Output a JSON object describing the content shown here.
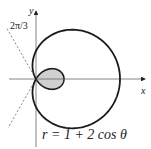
{
  "diagram": {
    "type": "polar-curve",
    "curve_name": "limacon",
    "equation_label": "r = 1 + 2 cos θ",
    "angle_label": "2π/3",
    "axis_labels": {
      "x": "x",
      "y": "y"
    },
    "parameters": {
      "a": 1,
      "b": 2
    },
    "shaded_region": "inner loop",
    "boundary_angles": [
      "2π/3",
      "4π/3"
    ],
    "colors": {
      "curve": "#1a1a1a",
      "axes": "#555555",
      "shade": "#d0d0d0",
      "dashed": "#666666"
    }
  }
}
